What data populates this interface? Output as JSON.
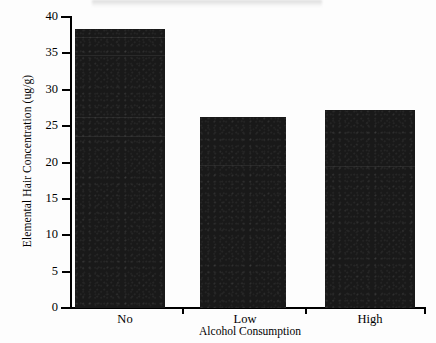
{
  "chart_data": {
    "type": "bar",
    "title": "",
    "subtitle": "",
    "categories": [
      "No",
      "Low",
      "High"
    ],
    "values": [
      38.3,
      26.2,
      27.2
    ],
    "series": [
      {
        "name": "Elemental Hair Concentration",
        "values": [
          38.3,
          26.2,
          27.2
        ]
      }
    ],
    "xlabel": "Alcohol Consumption",
    "ylabel": "Elemental Hair Concentration (ug/g)",
    "ylim": [
      0,
      40
    ],
    "ytick_values": [
      0,
      5,
      10,
      15,
      20,
      25,
      30,
      35,
      40
    ],
    "ytick_labels": [
      "0",
      "5",
      "10",
      "15",
      "20",
      "25",
      "30",
      "35",
      "40"
    ],
    "grid": false,
    "legend": false,
    "legend_position": "none",
    "bar_color": "#191919",
    "background_color": "#ffffff",
    "axis_color": "#000000"
  },
  "figure": {
    "y_axis_label": "Elemental Hair Concentration (ug/g)",
    "x_axis_label": "Alcohol Consumption",
    "y_ticks": [
      "40",
      "35",
      "30",
      "25",
      "20",
      "15",
      "10",
      "5",
      "0"
    ],
    "x_ticks": [
      "No",
      "Low",
      "High"
    ]
  }
}
